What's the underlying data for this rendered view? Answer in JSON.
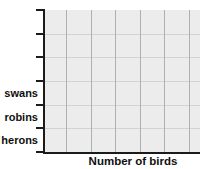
{
  "chart_data": {
    "type": "bar",
    "orientation": "horizontal",
    "title": "",
    "xlabel": "Number of birds",
    "ylabel": "",
    "categories": [
      "swans",
      "robins",
      "herons"
    ],
    "series": [
      {
        "name": "Number of birds",
        "values": [
          null,
          null,
          null
        ]
      }
    ],
    "y_axis": {
      "tick_count": 7,
      "band_count": 6,
      "labeled_bands": 3,
      "tick_labels_visible": true
    },
    "x_axis": {
      "numeric_tick_labels_visible": false
    },
    "grid": {
      "visible": true
    },
    "state": "blank grid — no bars plotted"
  },
  "colors": {
    "axis": "#1b1b1b",
    "grid_bg": "#ececec",
    "gridline_h": "#d2d2d2",
    "gridline_v": "#b0b0b0",
    "text": "#101010",
    "page_bg": "#ffffff"
  }
}
